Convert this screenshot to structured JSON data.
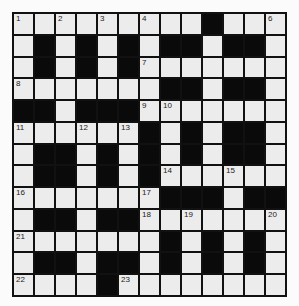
{
  "puzzle": {
    "rows": 13,
    "cols": 13,
    "layout": [
      ".........#...",
      ".#.#.#.##.##.",
      ".#.#.#.......",
      ".......##.##.",
      "##.###.......",
      "......#.#.##.",
      ".##.#.#.#.##.",
      ".##.#.#......",
      ".......###.##",
      ".##.##.......",
      ".......#.#.#.",
      ".##.##.#.#.#.",
      "....#........"
    ],
    "numbers": [
      {
        "r": 0,
        "c": 0,
        "n": "1"
      },
      {
        "r": 0,
        "c": 2,
        "n": "2"
      },
      {
        "r": 0,
        "c": 4,
        "n": "3"
      },
      {
        "r": 0,
        "c": 6,
        "n": "4"
      },
      {
        "r": 0,
        "c": 9,
        "n": "5"
      },
      {
        "r": 0,
        "c": 12,
        "n": "6"
      },
      {
        "r": 2,
        "c": 6,
        "n": "7"
      },
      {
        "r": 3,
        "c": 0,
        "n": "8"
      },
      {
        "r": 4,
        "c": 6,
        "n": "9"
      },
      {
        "r": 4,
        "c": 7,
        "n": "10"
      },
      {
        "r": 5,
        "c": 0,
        "n": "11"
      },
      {
        "r": 5,
        "c": 3,
        "n": "12"
      },
      {
        "r": 5,
        "c": 5,
        "n": "13"
      },
      {
        "r": 7,
        "c": 7,
        "n": "14"
      },
      {
        "r": 7,
        "c": 10,
        "n": "15"
      },
      {
        "r": 8,
        "c": 0,
        "n": "16"
      },
      {
        "r": 8,
        "c": 6,
        "n": "17"
      },
      {
        "r": 9,
        "c": 6,
        "n": "18"
      },
      {
        "r": 9,
        "c": 8,
        "n": "19"
      },
      {
        "r": 9,
        "c": 12,
        "n": "20"
      },
      {
        "r": 10,
        "c": 0,
        "n": "21"
      },
      {
        "r": 12,
        "c": 0,
        "n": "22"
      },
      {
        "r": 12,
        "c": 5,
        "n": "23"
      }
    ]
  },
  "colors": {
    "block": "#0a0a0a",
    "cell": "#ececec",
    "line": "#111111"
  }
}
